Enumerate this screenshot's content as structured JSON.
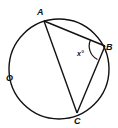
{
  "diagram": {
    "type": "inscribed-triangle-in-circle",
    "circle": {
      "label": "O",
      "cx": 59,
      "cy": 69,
      "r": 50
    },
    "points": [
      {
        "label": "A",
        "x": 44,
        "y": 21
      },
      {
        "label": "B",
        "x": 105,
        "y": 46
      },
      {
        "label": "C",
        "x": 77,
        "y": 113
      }
    ],
    "segments": [
      "AB",
      "BC",
      "AC"
    ],
    "angle": {
      "vertex": "B",
      "label": "x°"
    },
    "colors": {
      "stroke": "#111111",
      "background": "#ffffff"
    }
  }
}
